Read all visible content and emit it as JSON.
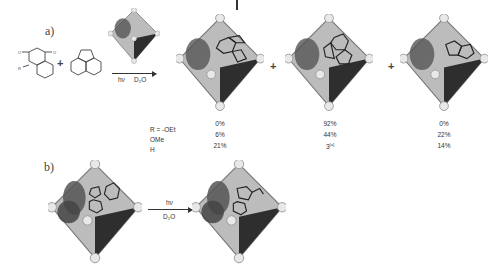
{
  "panel_a": {
    "label": "a)",
    "plus_1": "+",
    "plus_2": "+",
    "plus_3": "+",
    "arrow_conditions": {
      "light": "hν",
      "solvent": "D₂O"
    },
    "reactants": [
      "substituted naphthoquinone",
      "acenaphthylene"
    ],
    "products": [
      "cycloadduct-1",
      "cycloadduct-2",
      "cycloadduct-3"
    ],
    "yield_table": {
      "row_labels": [
        "R = -OEt",
        "OMe",
        "H"
      ],
      "columns": [
        {
          "name": "product-1",
          "values": [
            "0%",
            "6%",
            "21%"
          ]
        },
        {
          "name": "product-2",
          "values": [
            "92%",
            "44%",
            "3"
          ],
          "note_on_row3": "[a]"
        },
        {
          "name": "product-3",
          "values": [
            "0%",
            "22%",
            "14%"
          ]
        }
      ]
    }
  },
  "panel_b": {
    "label": "b)",
    "arrow_conditions": {
      "light": "hν",
      "solvent": "D₂O"
    }
  },
  "colors": {
    "cage_face": "#b9b9b9",
    "cage_dark": "#2a2a2a",
    "cage_node": "#e6e6e6",
    "text": "#333333"
  }
}
